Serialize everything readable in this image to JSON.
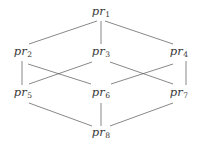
{
  "diagram": {
    "type": "hasse-diagram",
    "title": "",
    "width": 202,
    "height": 148,
    "background_color": "#ffffff",
    "line_color": "#555555",
    "text_color": "#3a3a3a",
    "node_prefix": "pr",
    "nodes": [
      {
        "id": "pr1",
        "label_base": "pr",
        "label_sub": "1",
        "label": "pr1",
        "x": 101,
        "y": 12,
        "level": 1
      },
      {
        "id": "pr2",
        "label_base": "pr",
        "label_sub": "2",
        "label": "pr2",
        "x": 23,
        "y": 52,
        "level": 2
      },
      {
        "id": "pr3",
        "label_base": "pr",
        "label_sub": "3",
        "label": "pr3",
        "x": 101,
        "y": 52,
        "level": 2
      },
      {
        "id": "pr4",
        "label_base": "pr",
        "label_sub": "4",
        "label": "pr4",
        "x": 179,
        "y": 52,
        "level": 2
      },
      {
        "id": "pr5",
        "label_base": "pr",
        "label_sub": "5",
        "label": "pr5",
        "x": 23,
        "y": 93,
        "level": 3
      },
      {
        "id": "pr6",
        "label_base": "pr",
        "label_sub": "6",
        "label": "pr6",
        "x": 101,
        "y": 93,
        "level": 3
      },
      {
        "id": "pr7",
        "label_base": "pr",
        "label_sub": "7",
        "label": "pr7",
        "x": 179,
        "y": 93,
        "level": 3
      },
      {
        "id": "pr8",
        "label_base": "pr",
        "label_sub": "8",
        "label": "pr8",
        "x": 101,
        "y": 133,
        "level": 4
      }
    ],
    "edges": [
      {
        "from": "pr1",
        "to": "pr2",
        "x1": 97,
        "y1": 21,
        "x2": 29,
        "y2": 44
      },
      {
        "from": "pr1",
        "to": "pr3",
        "x1": 101,
        "y1": 21,
        "x2": 101,
        "y2": 44
      },
      {
        "from": "pr1",
        "to": "pr4",
        "x1": 105,
        "y1": 21,
        "x2": 173,
        "y2": 44
      },
      {
        "from": "pr2",
        "to": "pr5",
        "x1": 22,
        "y1": 61,
        "x2": 22,
        "y2": 85
      },
      {
        "from": "pr2",
        "to": "pr6",
        "x1": 28,
        "y1": 64,
        "x2": 91,
        "y2": 84
      },
      {
        "from": "pr3",
        "to": "pr5",
        "x1": 92,
        "y1": 62,
        "x2": 29,
        "y2": 84
      },
      {
        "from": "pr3",
        "to": "pr7",
        "x1": 110,
        "y1": 62,
        "x2": 173,
        "y2": 84
      },
      {
        "from": "pr4",
        "to": "pr6",
        "x1": 173,
        "y1": 64,
        "x2": 111,
        "y2": 84
      },
      {
        "from": "pr4",
        "to": "pr7",
        "x1": 186,
        "y1": 61,
        "x2": 186,
        "y2": 85
      },
      {
        "from": "pr5",
        "to": "pr8",
        "x1": 29,
        "y1": 103,
        "x2": 92,
        "y2": 126
      },
      {
        "from": "pr6",
        "to": "pr8",
        "x1": 101,
        "y1": 103,
        "x2": 101,
        "y2": 126
      },
      {
        "from": "pr7",
        "to": "pr8",
        "x1": 173,
        "y1": 103,
        "x2": 110,
        "y2": 126
      }
    ]
  }
}
